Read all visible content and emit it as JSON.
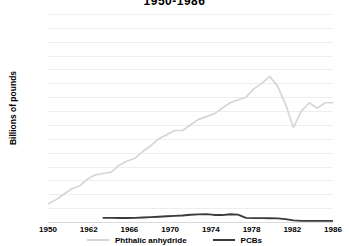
{
  "chart_data": {
    "type": "line",
    "title": "1950-1986",
    "xlabel": "",
    "ylabel": "Billions of pounds",
    "ylim": [
      0.0,
      1.5
    ],
    "xlim": [
      1950,
      1986
    ],
    "grid": true,
    "legend_position": "bottom",
    "ytick_labels": [
      "1.5",
      "1.4",
      "1.3",
      "1.2",
      "1.1",
      "1.0",
      "0.9",
      "0.8",
      "0.7",
      "0.6",
      "0.5",
      "0.4",
      "0.3",
      "0.2",
      "0.1",
      "0.0"
    ],
    "ytick_values": [
      1.5,
      1.4,
      1.3,
      1.2,
      1.1,
      1.0,
      0.9,
      0.8,
      0.7,
      0.6,
      0.5,
      0.4,
      0.3,
      0.2,
      0.1,
      0.0
    ],
    "xtick_labels": [
      "1950",
      "1962",
      "1966",
      "1970",
      "1974",
      "1978",
      "1982",
      "1986"
    ],
    "xtick_positions": [
      0,
      1,
      2,
      3,
      4,
      5,
      6,
      7
    ],
    "colors": {
      "phthalic_anhydride": "#d6d6d6",
      "pcbs": "#3b3b3b",
      "gridline": "#eeeeee",
      "text": "#000000",
      "background": "#ffffff"
    },
    "series": [
      {
        "name": "Phthalic anhydride",
        "color": "#d6d6d6",
        "x": [
          1950,
          1951,
          1952,
          1953,
          1954,
          1955,
          1956,
          1957,
          1958,
          1959,
          1960,
          1961,
          1962,
          1963,
          1964,
          1965,
          1966,
          1967,
          1968,
          1969,
          1970,
          1971,
          1972,
          1973,
          1974,
          1975,
          1976,
          1977,
          1978,
          1979,
          1980,
          1981,
          1982,
          1983,
          1984,
          1985,
          1986
        ],
        "values": [
          0.13,
          0.16,
          0.2,
          0.24,
          0.26,
          0.31,
          0.34,
          0.35,
          0.36,
          0.41,
          0.44,
          0.46,
          0.51,
          0.55,
          0.6,
          0.63,
          0.66,
          0.66,
          0.7,
          0.74,
          0.76,
          0.78,
          0.82,
          0.86,
          0.88,
          0.9,
          0.96,
          1.0,
          1.05,
          0.98,
          0.85,
          0.68,
          0.8,
          0.86,
          0.82,
          0.86,
          0.86
        ]
      },
      {
        "name": "PCBs",
        "color": "#3b3b3b",
        "x": [
          1950,
          1951,
          1952,
          1953,
          1954,
          1955,
          1956,
          1957,
          1958,
          1959,
          1960,
          1961,
          1962,
          1963,
          1964,
          1965,
          1966,
          1967,
          1968,
          1969,
          1970,
          1971,
          1972,
          1973,
          1974,
          1975,
          1976,
          1977,
          1978,
          1979,
          1980,
          1981,
          1982,
          1983,
          1984,
          1985,
          1986
        ],
        "values": [
          null,
          null,
          null,
          null,
          null,
          null,
          null,
          0.03,
          0.03,
          0.029,
          0.029,
          0.03,
          0.032,
          0.035,
          0.038,
          0.041,
          0.044,
          0.047,
          0.052,
          0.055,
          0.057,
          0.051,
          0.05,
          0.056,
          0.053,
          0.03,
          0.028,
          0.028,
          0.027,
          0.026,
          0.021,
          0.012,
          0.008,
          0.008,
          0.008,
          0.008,
          0.008
        ]
      }
    ]
  }
}
